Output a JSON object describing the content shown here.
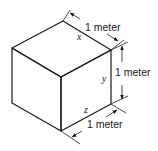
{
  "figure": {
    "edges": {
      "x": {
        "variable": "x",
        "dimension_label": "1 meter"
      },
      "y": {
        "variable": "y",
        "dimension_label": "1 meter"
      },
      "z": {
        "variable": "z",
        "dimension_label": "1 meter"
      }
    }
  }
}
